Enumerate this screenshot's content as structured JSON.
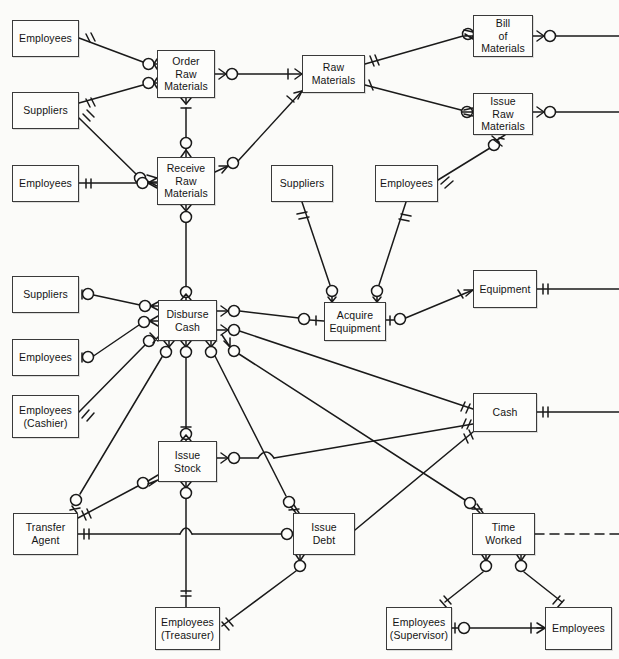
{
  "diagram": {
    "notation": "crow's-foot entity-relationship",
    "background_color": "#fbfbf9",
    "line_color": "#1a1a1a",
    "box_border_color": "#3a3a3a",
    "box_fill_color": "#fdfdfb",
    "width": 619,
    "height": 659,
    "nodes": [
      {
        "id": "employees_order",
        "label": "Employees",
        "lines": [
          "Employees"
        ],
        "x": 12,
        "y": 20,
        "w": 67,
        "h": 37
      },
      {
        "id": "order_raw_materials",
        "label": "Order Raw Materials",
        "lines": [
          "Order",
          "Raw",
          "Materials"
        ],
        "x": 157,
        "y": 50,
        "w": 58,
        "h": 48
      },
      {
        "id": "raw_materials",
        "label": "Raw Materials",
        "lines": [
          "Raw",
          "Materials"
        ],
        "x": 302,
        "y": 55,
        "w": 63,
        "h": 38
      },
      {
        "id": "bill_of_materials",
        "label": "Bill of Materials",
        "lines": [
          "Bill",
          "of",
          "Materials"
        ],
        "x": 473,
        "y": 15,
        "w": 60,
        "h": 42
      },
      {
        "id": "suppliers_order",
        "label": "Suppliers",
        "lines": [
          "Suppliers"
        ],
        "x": 12,
        "y": 92,
        "w": 67,
        "h": 37
      },
      {
        "id": "issue_raw_materials",
        "label": "Issue Raw Materials",
        "lines": [
          "Issue",
          "Raw",
          "Materials"
        ],
        "x": 473,
        "y": 93,
        "w": 60,
        "h": 42
      },
      {
        "id": "employees_receive",
        "label": "Employees",
        "lines": [
          "Employees"
        ],
        "x": 12,
        "y": 165,
        "w": 67,
        "h": 37
      },
      {
        "id": "receive_raw_materials",
        "label": "Receive Raw Materials",
        "lines": [
          "Receive",
          "Raw",
          "Materials"
        ],
        "x": 157,
        "y": 157,
        "w": 58,
        "h": 48
      },
      {
        "id": "suppliers_acquire",
        "label": "Suppliers",
        "lines": [
          "Suppliers"
        ],
        "x": 271,
        "y": 165,
        "w": 62,
        "h": 37
      },
      {
        "id": "employees_acquire",
        "label": "Employees",
        "lines": [
          "Employees"
        ],
        "x": 375,
        "y": 165,
        "w": 63,
        "h": 37
      },
      {
        "id": "suppliers_disburse",
        "label": "Suppliers",
        "lines": [
          "Suppliers"
        ],
        "x": 12,
        "y": 276,
        "w": 67,
        "h": 37
      },
      {
        "id": "disburse_cash",
        "label": "Disburse Cash",
        "lines": [
          "Disburse",
          "Cash"
        ],
        "x": 158,
        "y": 300,
        "w": 59,
        "h": 41
      },
      {
        "id": "acquire_equipment",
        "label": "Acquire Equipment",
        "lines": [
          "Acquire",
          "Equipment"
        ],
        "x": 324,
        "y": 302,
        "w": 62,
        "h": 39
      },
      {
        "id": "equipment",
        "label": "Equipment",
        "lines": [
          "Equipment"
        ],
        "x": 473,
        "y": 270,
        "w": 64,
        "h": 38
      },
      {
        "id": "employees_disburse",
        "label": "Employees",
        "lines": [
          "Employees"
        ],
        "x": 12,
        "y": 339,
        "w": 67,
        "h": 37
      },
      {
        "id": "employees_cashier",
        "label": "Employees (Cashier)",
        "lines": [
          "Employees",
          "(Cashier)"
        ],
        "x": 12,
        "y": 395,
        "w": 67,
        "h": 43
      },
      {
        "id": "cash",
        "label": "Cash",
        "lines": [
          "Cash"
        ],
        "x": 473,
        "y": 393,
        "w": 64,
        "h": 39
      },
      {
        "id": "issue_stock",
        "label": "Issue Stock",
        "lines": [
          "Issue",
          "Stock"
        ],
        "x": 158,
        "y": 441,
        "w": 59,
        "h": 41
      },
      {
        "id": "transfer_agent",
        "label": "Transfer Agent",
        "lines": [
          "Transfer",
          "Agent"
        ],
        "x": 13,
        "y": 513,
        "w": 65,
        "h": 42
      },
      {
        "id": "issue_debt",
        "label": "Issue Debt",
        "lines": [
          "Issue",
          "Debt"
        ],
        "x": 293,
        "y": 513,
        "w": 62,
        "h": 42
      },
      {
        "id": "time_worked",
        "label": "Time Worked",
        "lines": [
          "Time",
          "Worked"
        ],
        "x": 472,
        "y": 513,
        "w": 63,
        "h": 42
      },
      {
        "id": "employees_treasurer",
        "label": "Employees (Treasurer)",
        "lines": [
          "Employees",
          "(Treasurer)"
        ],
        "x": 155,
        "y": 607,
        "w": 65,
        "h": 43
      },
      {
        "id": "employees_supervisor",
        "label": "Employees (Supervisor)",
        "lines": [
          "Employees",
          "(Supervisor)"
        ],
        "x": 386,
        "y": 607,
        "w": 66,
        "h": 43
      },
      {
        "id": "employees_subordinate",
        "label": "Employees",
        "lines": [
          "Employees"
        ],
        "x": 545,
        "y": 607,
        "w": 67,
        "h": 43
      }
    ],
    "edges": [
      {
        "from": "employees_order",
        "to": "order_raw_materials",
        "from_card": "one-mandatory",
        "to_card": "many-optional"
      },
      {
        "from": "suppliers_order",
        "to": "order_raw_materials",
        "from_card": "one-mandatory",
        "to_card": "many-optional"
      },
      {
        "from": "order_raw_materials",
        "to": "raw_materials",
        "from_card": "many-optional",
        "to_card": "one-mandatory"
      },
      {
        "from": "order_raw_materials",
        "to": "receive_raw_materials",
        "from_card": "one-mandatory",
        "to_card": "many-optional"
      },
      {
        "from": "suppliers_order",
        "to": "receive_raw_materials",
        "from_card": "one-mandatory",
        "to_card": "many-optional"
      },
      {
        "from": "employees_receive",
        "to": "receive_raw_materials",
        "from_card": "one-mandatory",
        "to_card": "many-optional"
      },
      {
        "from": "receive_raw_materials",
        "to": "raw_materials",
        "from_card": "many-optional",
        "to_card": "one-mandatory"
      },
      {
        "from": "raw_materials",
        "to": "bill_of_materials",
        "from_card": "one-mandatory",
        "to_card": "many-optional"
      },
      {
        "from": "raw_materials",
        "to": "issue_raw_materials",
        "from_card": "one-mandatory",
        "to_card": "many-optional"
      },
      {
        "from": "bill_of_materials",
        "to": "edge-right",
        "from_card": "many-optional",
        "to_card": "none"
      },
      {
        "from": "issue_raw_materials",
        "to": "edge-right",
        "from_card": "many-optional",
        "to_card": "none"
      },
      {
        "from": "employees_acquire",
        "to": "issue_raw_materials",
        "from_card": "one-mandatory",
        "to_card": "many-optional"
      },
      {
        "from": "receive_raw_materials",
        "to": "disburse_cash",
        "from_card": "many-optional",
        "to_card": "many-optional"
      },
      {
        "from": "suppliers_disburse",
        "to": "disburse_cash",
        "from_card": "one-optional",
        "to_card": "many-optional"
      },
      {
        "from": "employees_disburse",
        "to": "disburse_cash",
        "from_card": "one-optional",
        "to_card": "many-optional"
      },
      {
        "from": "employees_cashier",
        "to": "disburse_cash",
        "from_card": "one-mandatory",
        "to_card": "many-optional"
      },
      {
        "from": "suppliers_acquire",
        "to": "acquire_equipment",
        "from_card": "one-mandatory",
        "to_card": "many-optional"
      },
      {
        "from": "employees_acquire",
        "to": "acquire_equipment",
        "from_card": "one-mandatory",
        "to_card": "many-optional"
      },
      {
        "from": "disburse_cash",
        "to": "acquire_equipment",
        "from_card": "many-optional",
        "to_card": "one-mandatory"
      },
      {
        "from": "acquire_equipment",
        "to": "equipment",
        "from_card": "many-optional",
        "to_card": "one-mandatory"
      },
      {
        "from": "equipment",
        "to": "edge-right",
        "from_card": "one-mandatory",
        "to_card": "none"
      },
      {
        "from": "cash",
        "to": "edge-right",
        "from_card": "one-mandatory",
        "to_card": "none"
      },
      {
        "from": "disburse_cash",
        "to": "cash",
        "from_card": "many-optional",
        "to_card": "one-mandatory"
      },
      {
        "from": "disburse_cash",
        "to": "issue_stock",
        "from_card": "many-optional",
        "to_card": "one-mandatory"
      },
      {
        "from": "disburse_cash",
        "to": "issue_debt",
        "from_card": "many-optional",
        "to_card": "many-optional"
      },
      {
        "from": "disburse_cash",
        "to": "time_worked",
        "from_card": "many-optional",
        "to_card": "many-optional"
      },
      {
        "from": "disburse_cash",
        "to": "transfer_agent",
        "from_card": "many-optional",
        "to_card": "one-mandatory"
      },
      {
        "from": "transfer_agent",
        "to": "issue_stock",
        "from_card": "one-mandatory",
        "to_card": "many-optional"
      },
      {
        "from": "transfer_agent",
        "to": "issue_debt",
        "from_card": "one-mandatory",
        "to_card": "many-optional"
      },
      {
        "from": "issue_stock",
        "to": "cash",
        "from_card": "many-optional",
        "to_card": "one-mandatory"
      },
      {
        "from": "issue_debt",
        "to": "cash",
        "from_card": "many-optional",
        "to_card": "one-mandatory"
      },
      {
        "from": "issue_stock",
        "to": "employees_treasurer",
        "from_card": "many-optional",
        "to_card": "one-mandatory"
      },
      {
        "from": "issue_debt",
        "to": "employees_treasurer",
        "from_card": "many-optional",
        "to_card": "one-mandatory"
      },
      {
        "from": "time_worked",
        "to": "employees_supervisor",
        "from_card": "many-optional",
        "to_card": "one-mandatory"
      },
      {
        "from": "time_worked",
        "to": "employees_subordinate",
        "from_card": "many-optional",
        "to_card": "one-mandatory"
      },
      {
        "from": "employees_supervisor",
        "to": "employees_subordinate",
        "from_card": "one-optional",
        "to_card": "many-mandatory"
      },
      {
        "from": "time_worked",
        "to": "edge-right-dashed",
        "from_card": "none",
        "to_card": "none",
        "style": "dashed"
      }
    ]
  }
}
